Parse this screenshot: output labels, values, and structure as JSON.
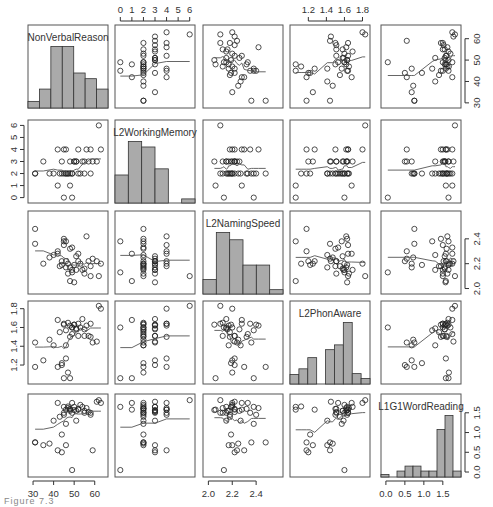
{
  "chart_data": {
    "type": "scatter",
    "subtype": "pairs-matrix",
    "title": "",
    "variables": [
      "NonVerbalReason",
      "L2WorkingMemory",
      "L2NamingSpeed",
      "L2PhonAware",
      "L1G1WordReading"
    ],
    "axis_ticks": {
      "NonVerbalReason": {
        "ticks": [
          30,
          40,
          50,
          60
        ],
        "range": [
          29,
          65
        ],
        "location": "bottom col1 / right row1"
      },
      "L2WorkingMemory": {
        "ticks": [
          0,
          1,
          2,
          3,
          4,
          5,
          6
        ],
        "range": [
          -0.2,
          6.2
        ],
        "location": "top col2 / left row2"
      },
      "L2NamingSpeed": {
        "ticks": [
          2.0,
          2.2,
          2.4
        ],
        "range": [
          1.98,
          2.6
        ],
        "location": "bottom col3 / right row3"
      },
      "L2PhonAware": {
        "ticks": [
          1.2,
          1.4,
          1.6,
          1.8
        ],
        "range": [
          1.03,
          1.85
        ],
        "location": "top col4 / left row4"
      },
      "L1G1WordReading": {
        "ticks": [
          0.0,
          0.5,
          1.0,
          1.5
        ],
        "range": [
          -0.05,
          1.9
        ],
        "location": "bottom col5 / right row5"
      }
    },
    "histograms": {
      "NonVerbalReason": [
        0.07,
        0.2,
        0.65,
        0.65,
        0.37,
        0.31,
        0.2
      ],
      "L2WorkingMemory": [
        0.41,
        0.9,
        0.82,
        0.5,
        0.0,
        0.06
      ],
      "L2NamingSpeed": [
        0.2,
        0.85,
        0.75,
        0.4,
        0.4,
        0.06
      ],
      "L2PhonAware": [
        0.12,
        0.19,
        0.33,
        0.0,
        0.43,
        0.49,
        0.77,
        0.13,
        0.07
      ],
      "L1G1WordReading": [
        0.05,
        0.0,
        0.12,
        0.22,
        0.22,
        0.12,
        0.12,
        0.96,
        1.24,
        0.12
      ]
    },
    "data": {
      "NonVerbalReason": [
        31,
        31,
        35,
        38,
        40,
        42,
        42,
        43,
        44,
        44,
        45,
        45,
        45,
        46,
        46,
        46,
        47,
        47,
        48,
        48,
        48,
        49,
        49,
        49,
        50,
        50,
        51,
        51,
        52,
        52,
        53,
        54,
        55,
        55,
        56,
        57,
        58,
        58,
        59,
        61,
        62,
        63
      ],
      "L2WorkingMemory": [
        2,
        2,
        3,
        2,
        2,
        4,
        1,
        2,
        3,
        2,
        4,
        2,
        0,
        2,
        2,
        4,
        2,
        2,
        1,
        3,
        2,
        2,
        0,
        2,
        3,
        3,
        3,
        3,
        2,
        4,
        2,
        3,
        3,
        2,
        4,
        3,
        2,
        4,
        3,
        3,
        6,
        4
      ],
      "L2NamingSpeed": [
        2.48,
        2.36,
        2.2,
        2.25,
        2.27,
        2.3,
        2.28,
        2.18,
        2.22,
        2.19,
        2.35,
        2.4,
        2.38,
        2.38,
        2.17,
        2.22,
        2.2,
        2.12,
        2.06,
        2.17,
        2.32,
        2.33,
        2.13,
        2.15,
        2.05,
        2.19,
        2.15,
        2.26,
        2.22,
        2.28,
        2.2,
        2.15,
        2.12,
        2.16,
        2.42,
        2.22,
        2.1,
        2.18,
        2.24,
        2.22,
        2.1,
        2.2
      ],
      "L2PhonAware": [
        1.18,
        1.44,
        1.25,
        1.47,
        1.41,
        1.18,
        1.68,
        1.55,
        1.2,
        1.22,
        1.64,
        1.63,
        1.06,
        1.57,
        1.41,
        1.27,
        1.12,
        1.65,
        1.06,
        1.62,
        1.5,
        1.53,
        1.6,
        1.6,
        1.63,
        1.63,
        1.59,
        1.58,
        1.51,
        1.64,
        1.6,
        1.69,
        1.51,
        1.58,
        1.62,
        1.51,
        1.64,
        1.5,
        1.44,
        1.45,
        1.83,
        1.8
      ],
      "L1G1WordReading": [
        0.75,
        0.75,
        0.68,
        0.72,
        1.3,
        0.55,
        1.75,
        1.4,
        0.5,
        0.95,
        1.5,
        1.45,
        1.65,
        1.22,
        0.68,
        1.58,
        1.66,
        1.62,
        1.58,
        1.55,
        1.6,
        1.75,
        0.05,
        1.5,
        1.57,
        1.65,
        1.3,
        1.55,
        1.6,
        1.58,
        1.7,
        1.65,
        1.5,
        1.55,
        1.62,
        1.52,
        1.5,
        1.45,
        0.55,
        1.78,
        1.82,
        1.75
      ]
    },
    "smoother": "lowess",
    "grid": false,
    "legend": null
  },
  "caption": "Figure 7.3"
}
